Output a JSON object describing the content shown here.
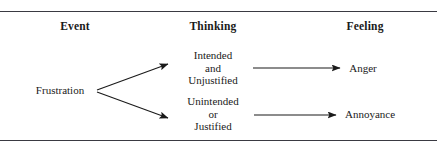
{
  "figure": {
    "type": "flow-diagram",
    "title": "",
    "columns": [
      {
        "id": "event",
        "label": "Event"
      },
      {
        "id": "thinking",
        "label": "Thinking"
      },
      {
        "id": "feeling",
        "label": "Feeling"
      }
    ],
    "nodes": {
      "frustration": {
        "lines": [
          "Frustration"
        ]
      },
      "intended": {
        "lines": [
          "Intended",
          "and",
          "Unjustified"
        ]
      },
      "unintended": {
        "lines": [
          "Unintended",
          "or",
          "Justified"
        ]
      },
      "anger": {
        "lines": [
          "Anger"
        ]
      },
      "annoyance": {
        "lines": [
          "Annoyance"
        ]
      }
    },
    "edges": [
      {
        "from": "frustration",
        "to": "intended",
        "style": "arrow"
      },
      {
        "from": "frustration",
        "to": "unintended",
        "style": "arrow"
      },
      {
        "from": "intended",
        "to": "anger",
        "style": "arrow"
      },
      {
        "from": "unintended",
        "to": "annoyance",
        "style": "arrow"
      }
    ],
    "rules": {
      "top_label": "top-rule",
      "bottom_label": "bottom-rule"
    },
    "colors": {
      "background": "#ffffff",
      "text": "#1a1a1a",
      "rule": "#3a3a42",
      "arrow": "#1a1a1a"
    }
  }
}
